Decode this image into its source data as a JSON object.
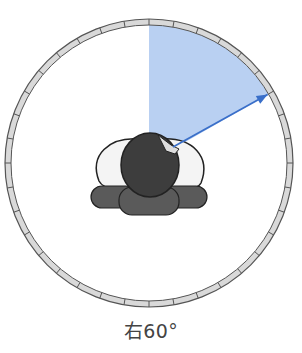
{
  "diagram": {
    "center": [
      149,
      163
    ],
    "ring_outer_radius": 144,
    "ring_inner_radius": 138,
    "tick_step_degrees": 10,
    "sector_start_degrees": 0,
    "sector_end_degrees": 60,
    "arrow_angle_degrees": 60,
    "colors": {
      "ring_fill": "#d9d9d9",
      "ring_stroke": "#555555",
      "sector_fill": "#b9d0f2",
      "arrow": "#3a6fc9",
      "head": "#3d3d3d",
      "shoulders": "#f4f4f4",
      "body": "#5a5a5a",
      "outline": "#222222"
    }
  },
  "caption": {
    "label": "右60°"
  }
}
